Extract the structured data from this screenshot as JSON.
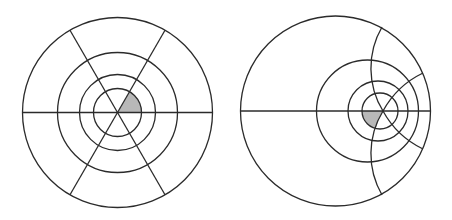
{
  "figure": {
    "colors": {
      "line": "#2b2b2b",
      "shade": "#b8b8b8",
      "background": "#ffffff"
    },
    "left_panel": {
      "label": "original-polar-grid",
      "center": [
        117.5,
        112.5
      ],
      "radii": [
        95,
        60,
        38,
        24
      ],
      "spoke_angles_deg": [
        0,
        60,
        120,
        180,
        240,
        300
      ],
      "shaded_cell": "inner disk sector 0°–60°"
    },
    "right_panel": {
      "label": "transformed-polar-grid",
      "outer_circle": {
        "center": [
          335.5,
          111
        ],
        "r": 95
      },
      "circles": [
        {
          "center": [
            367.5,
            111
          ],
          "r": 51
        },
        {
          "center": [
            378,
            111
          ],
          "r": 30
        },
        {
          "center": [
            380,
            111
          ],
          "r": 18
        }
      ],
      "focus": [
        383,
        111
      ],
      "shaded_cell": "image of inner sector, lower-left of focus"
    }
  }
}
